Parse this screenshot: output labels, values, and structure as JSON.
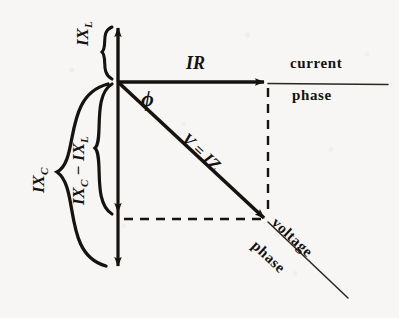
{
  "figure": {
    "background_color": "#f7f6f4",
    "ink_color": "#15120f"
  },
  "labels": {
    "ix_l_top": "IX",
    "ix_l_top_sub": "L",
    "ix_c_outer": "IX",
    "ix_c_outer_sub": "C",
    "ix_diff_lead": "IX",
    "ix_diff_lead_sub": "C",
    "ix_diff_minus": " − IX",
    "ix_diff_trail_sub": "L",
    "ir": "IR",
    "phi": "ϕ",
    "v_iz": "V = IZ",
    "current_line_1": "current",
    "current_line_2": "phase",
    "voltage_line_1": "voltage",
    "voltage_line_2": "phase"
  },
  "geometry": {
    "origin": {
      "x": 118,
      "y": 82
    },
    "ir_tip": {
      "x": 268,
      "y": 82
    },
    "v_tip": {
      "x": 268,
      "y": 222
    },
    "vertical_up_tip": {
      "x": 118,
      "y": 24
    },
    "vertical_mid_arrow": {
      "x": 118,
      "y": 216
    },
    "vertical_down_tip": {
      "x": 118,
      "y": 270
    },
    "current_axis_end": {
      "x": 388,
      "y": 84
    },
    "voltage_axis_end": {
      "x": 348,
      "y": 298
    },
    "phi_degrees": 43
  },
  "braces": [
    {
      "name": "ix-l-brace",
      "label": "IX_L",
      "from_y": 26,
      "to_y": 80,
      "tip_x": 104
    },
    {
      "name": "ix-diff-brace",
      "label": "IX_C - IX_L",
      "from_y": 84,
      "to_y": 214,
      "tip_x": 96
    },
    {
      "name": "ix-c-brace",
      "label": "IX_C",
      "from_y": 84,
      "to_y": 266,
      "tip_x": 58
    }
  ]
}
